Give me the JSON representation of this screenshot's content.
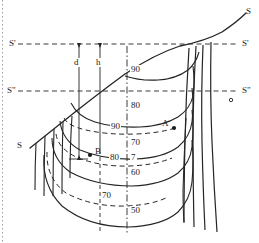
{
  "figure": {
    "colors": {
      "ink": "#1b1b1b",
      "line": "#242424",
      "margin_guide": "#9a9a9a"
    },
    "margin_guide": {
      "name": "left-page-margin-dotted-rule",
      "x": 2
    },
    "reference_lines": [
      {
        "id": "S",
        "label_left": "S",
        "label_right": "S",
        "style": "solid",
        "note": "inclined ground/surface profile curve"
      },
      {
        "id": "S1",
        "label_left": "S'",
        "label_right": "S'",
        "style": "dashed",
        "y": 44
      },
      {
        "id": "S2",
        "label_left": "S\"",
        "label_right": "S\"",
        "style": "dashed",
        "y": 91
      }
    ],
    "axis": {
      "name": "central-vertical-axis",
      "style": "dash-dot",
      "x": 127,
      "y_top": 46,
      "y_bottom": 235
    },
    "dimension_lines": [
      {
        "id": "d",
        "label": "d",
        "x": 79,
        "y_top": 44,
        "y_bottom": 159,
        "label_x": 73,
        "label_y": 62
      },
      {
        "id": "h",
        "label": "h",
        "x": 100,
        "y_top": 44,
        "y_bottom": 231,
        "label_x": 95,
        "label_y": 62
      }
    ],
    "solid_contour_labels": [
      {
        "value": "90",
        "x": 131,
        "y": 70
      },
      {
        "value": "80",
        "x": 131,
        "y": 106
      },
      {
        "value": "70",
        "x": 131,
        "y": 143
      },
      {
        "value": "60",
        "x": 131,
        "y": 173
      },
      {
        "value": "50",
        "x": 131,
        "y": 211
      }
    ],
    "dashed_contour_labels": [
      {
        "value": "90",
        "x": 113,
        "y": 127
      },
      {
        "value": "80",
        "x": 113,
        "y": 158
      },
      {
        "value": "7",
        "x": 131,
        "y": 158
      },
      {
        "value": "70",
        "x": 105,
        "y": 196
      }
    ],
    "points": [
      {
        "label": "A",
        "label_x": 161,
        "label_y": 124,
        "dot_x": 174,
        "dot_y": 128
      },
      {
        "label": "B",
        "label_x": 96,
        "label_y": 150,
        "dot_x": 90,
        "dot_y": 155
      }
    ],
    "markers": [
      {
        "name": "small-open-circle-marker",
        "x": 231,
        "y": 100,
        "r": 1.6
      }
    ],
    "edge_labels": {
      "s_top_right": "S",
      "s_left": "S",
      "s1_left": "S'",
      "s1_right": "S'",
      "s2_left": "S\"",
      "s2_right": "S\""
    }
  }
}
